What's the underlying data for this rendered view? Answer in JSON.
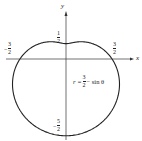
{
  "diagram": {
    "equation": {
      "r": "r =",
      "num": "3",
      "den": "2",
      "rest": "− sin θ"
    },
    "axes": {
      "x_label": "x",
      "y_label": "y"
    },
    "ticks": {
      "top": {
        "sign": "",
        "num": "1",
        "den": "2"
      },
      "left": {
        "sign": "−",
        "num": "3",
        "den": "2"
      },
      "right": {
        "sign": "",
        "num": "3",
        "den": "2"
      },
      "bottom": {
        "sign": "−",
        "num": "5",
        "den": "2"
      }
    },
    "curve_color": "#222222"
  }
}
